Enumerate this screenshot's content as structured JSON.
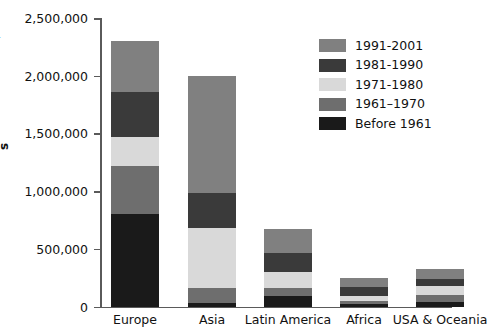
{
  "chart_data": {
    "type": "bar",
    "subtype": "stacked-bar",
    "title": "",
    "xlabel": "",
    "ylabel": "Number of People",
    "ylim": [
      0,
      2500000
    ],
    "ytick_values": [
      0,
      500000,
      1000000,
      1500000,
      2000000,
      2500000
    ],
    "ytick_labels": [
      "0",
      "500,000",
      "1,000,000",
      "1,500,000",
      "2,000,000",
      "2,500,000"
    ],
    "grid": false,
    "legend_position": "upper-right-inside",
    "categories": [
      "Europe",
      "Asia",
      "Latin America",
      "Africa",
      "USA & Oceania"
    ],
    "series": [
      {
        "name": "Before 1961",
        "color": "#1a1a1a",
        "values": [
          800000,
          30000,
          90000,
          25000,
          40000
        ]
      },
      {
        "name": "1961–1970",
        "color": "#6e6e6e",
        "values": [
          420000,
          130000,
          70000,
          20000,
          60000
        ]
      },
      {
        "name": "1971-1980",
        "color": "#d9d9d9",
        "values": [
          250000,
          520000,
          140000,
          45000,
          75000
        ]
      },
      {
        "name": "1981-1990",
        "color": "#3a3a3a",
        "values": [
          390000,
          300000,
          160000,
          80000,
          65000
        ]
      },
      {
        "name": "1991-2001",
        "color": "#808080",
        "values": [
          440000,
          1020000,
          215000,
          80000,
          85000
        ]
      }
    ],
    "totals": [
      2300000,
      2000000,
      675000,
      250000,
      325000
    ]
  },
  "axis": {
    "y_title": "Number of People",
    "y_title_clipped_glyph": "s"
  },
  "legend": {
    "items": [
      {
        "label": "1991-2001",
        "color": "#808080"
      },
      {
        "label": "1981-1990",
        "color": "#3a3a3a"
      },
      {
        "label": "1971-1980",
        "color": "#d9d9d9"
      },
      {
        "label": "1961–1970",
        "color": "#6e6e6e"
      },
      {
        "label": "Before 1961",
        "color": "#1a1a1a"
      }
    ]
  }
}
